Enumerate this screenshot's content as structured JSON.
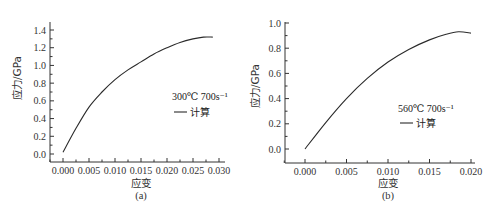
{
  "chart_data": [
    {
      "type": "line",
      "panel": "(a)",
      "xlabel": "应变",
      "ylabel": "应力/GPa",
      "xlim": [
        -0.003,
        0.032
      ],
      "ylim": [
        -0.15,
        1.5
      ],
      "xticks": [
        0.0,
        0.005,
        0.01,
        0.015,
        0.02,
        0.025,
        0.03
      ],
      "xtick_labels": [
        "0.000",
        "0.005",
        "0.010",
        "0.015",
        "0.020",
        "0.025",
        "0.030"
      ],
      "yticks": [
        0.0,
        0.2,
        0.4,
        0.6,
        0.8,
        1.0,
        1.2,
        1.4
      ],
      "ytick_labels": [
        "0.0",
        "0.2",
        "0.4",
        "0.6",
        "0.8",
        "1.0",
        "1.2",
        "1.4"
      ],
      "grid": false,
      "legend": {
        "title": "300℃  700s⁻¹",
        "entries": [
          "计算"
        ],
        "position": "right-middle"
      },
      "series": [
        {
          "name": "计算",
          "x": [
            0.0,
            0.0025,
            0.005,
            0.0075,
            0.01,
            0.0125,
            0.015,
            0.0175,
            0.02,
            0.0225,
            0.025,
            0.027,
            0.0288
          ],
          "y": [
            0.02,
            0.29,
            0.53,
            0.7,
            0.84,
            0.95,
            1.04,
            1.13,
            1.2,
            1.26,
            1.3,
            1.32,
            1.32
          ]
        }
      ]
    },
    {
      "type": "line",
      "panel": "(b)",
      "xlabel": "应变",
      "ylabel": "应力/GPa",
      "xlim": [
        -0.0025,
        0.0205
      ],
      "ylim": [
        -0.1,
        1.0
      ],
      "xticks": [
        0.0,
        0.005,
        0.01,
        0.015,
        0.02
      ],
      "xtick_labels": [
        "0.000",
        "0.005",
        "0.010",
        "0.015",
        "0.020"
      ],
      "yticks": [
        0.0,
        0.2,
        0.4,
        0.6,
        0.8,
        1.0
      ],
      "ytick_labels": [
        "0.0",
        "0.2",
        "0.4",
        "0.6",
        "0.8",
        "1.0"
      ],
      "grid": false,
      "legend": {
        "title": "560℃  700s⁻¹",
        "entries": [
          "计算"
        ],
        "position": "right-middle"
      },
      "series": [
        {
          "name": "计算",
          "x": [
            0.0,
            0.0025,
            0.005,
            0.0075,
            0.01,
            0.0125,
            0.015,
            0.017,
            0.0185,
            0.02
          ],
          "y": [
            0.0,
            0.21,
            0.4,
            0.56,
            0.69,
            0.79,
            0.866,
            0.91,
            0.93,
            0.92
          ]
        }
      ]
    }
  ],
  "panels": {
    "a": {
      "label": "(a)",
      "xlabel": "应变",
      "ylabel": "应力/GPa",
      "legend_title": "300℃  700s⁻¹",
      "legend_entry": "计算"
    },
    "b": {
      "label": "(b)",
      "xlabel": "应变",
      "ylabel": "应力/GPa",
      "legend_title": "560℃  700s⁻¹",
      "legend_entry": "计算"
    }
  },
  "colors": {
    "line": "#2a2a2a",
    "axis": "#333333"
  }
}
